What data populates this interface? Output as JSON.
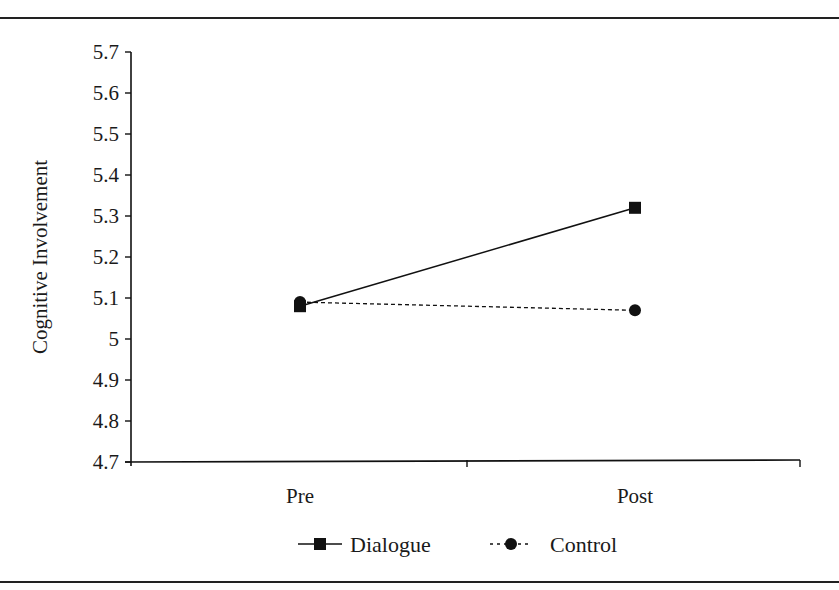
{
  "chart_data": {
    "type": "line",
    "title": "",
    "xlabel": "",
    "ylabel": "Cognitive Involvement",
    "categories": [
      "Pre",
      "Post"
    ],
    "ylim": [
      4.7,
      5.7
    ],
    "yticks": [
      "5.7",
      "5.6",
      "5.5",
      "5.4",
      "5.3",
      "5.2",
      "5.1",
      "5",
      "4.9",
      "4.8",
      "4.7"
    ],
    "grid": false,
    "legend_position": "bottom",
    "series": [
      {
        "name": "Dialogue",
        "values": [
          5.08,
          5.32
        ],
        "marker": "square",
        "line": "solid",
        "color": "#111111"
      },
      {
        "name": "Control",
        "values": [
          5.09,
          5.07
        ],
        "marker": "circle",
        "line": "dashed",
        "color": "#111111"
      }
    ]
  },
  "legend": {
    "items": [
      {
        "label": "Dialogue"
      },
      {
        "label": "Control"
      }
    ]
  }
}
